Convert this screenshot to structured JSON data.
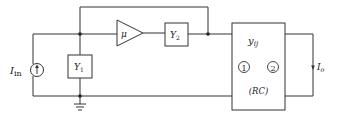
{
  "diagram": {
    "source_label_main": "I",
    "source_label_sub": "in",
    "y1_label_main": "Y",
    "y1_label_sub": "1",
    "amp_label": "μ",
    "y2_label_main": "Y",
    "y2_label_sub": "2",
    "network_label_main": "y",
    "network_label_sub": "ij",
    "port1_label": "1",
    "port2_label": "2",
    "network_type_label": "(RC)",
    "output_label_main": "I",
    "output_label_sub": "o",
    "line_color": "#333333"
  }
}
